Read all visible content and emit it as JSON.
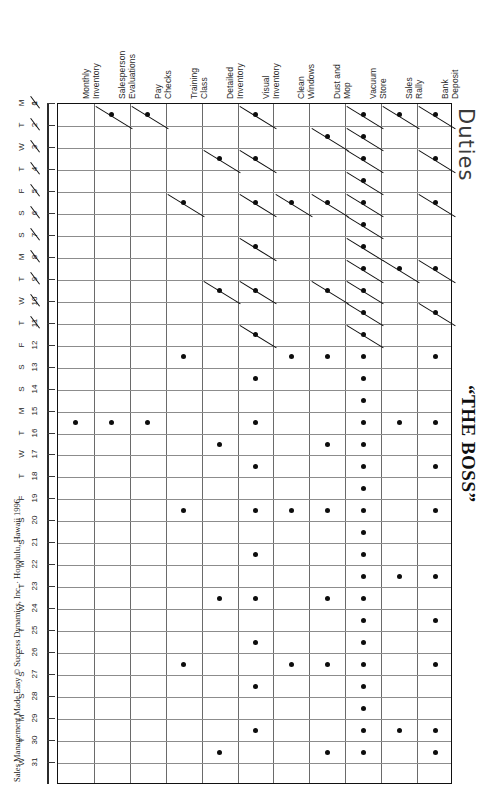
{
  "page": {
    "duties_title": "Duties",
    "boss_title": "“THE BOSS”",
    "credit": "Sales Management Made Easy © Success Dynamics, Inc. · Honolulu, Hawaii 1996",
    "origin_label": "0"
  },
  "columns": [
    {
      "id": "monthly-inventory",
      "line1": "Monthly",
      "line2": "Inventory"
    },
    {
      "id": "salesperson-evaluations",
      "line1": "Salesperson",
      "line2": "Evaluations"
    },
    {
      "id": "pay-checks",
      "line1": "Pay",
      "line2": "Checks"
    },
    {
      "id": "training-class",
      "line1": "Training",
      "line2": "Class"
    },
    {
      "id": "detailed-inventory",
      "line1": "Detailed",
      "line2": "Inventory"
    },
    {
      "id": "visual-inventory",
      "line1": "Visual",
      "line2": "Inventory"
    },
    {
      "id": "clean-windows",
      "line1": "Clean",
      "line2": "Windows"
    },
    {
      "id": "dust-and-mop",
      "line1": "Dust and",
      "line2": "Mop"
    },
    {
      "id": "vacuum-store",
      "line1": "Vacuum",
      "line2": "Store"
    },
    {
      "id": "sales-rally",
      "line1": "Sales",
      "line2": "Rally"
    },
    {
      "id": "bank-deposit",
      "line1": "Bank",
      "line2": "Deposit"
    }
  ],
  "rows": [
    {
      "num": "1",
      "day": "M",
      "struck": true
    },
    {
      "num": "2",
      "day": "T",
      "struck": true
    },
    {
      "num": "3",
      "day": "W",
      "struck": true
    },
    {
      "num": "4",
      "day": "T",
      "struck": true
    },
    {
      "num": "5",
      "day": "F",
      "struck": true
    },
    {
      "num": "6",
      "day": "S",
      "struck": true
    },
    {
      "num": "7",
      "day": "S",
      "struck": true
    },
    {
      "num": "8",
      "day": "M",
      "struck": true
    },
    {
      "num": "9",
      "day": "T",
      "struck": true
    },
    {
      "num": "10",
      "day": "W",
      "struck": true
    },
    {
      "num": "11",
      "day": "T",
      "struck": true
    },
    {
      "num": "12",
      "day": "F",
      "struck": false
    },
    {
      "num": "13",
      "day": "S",
      "struck": false
    },
    {
      "num": "14",
      "day": "S",
      "struck": false
    },
    {
      "num": "15",
      "day": "M",
      "struck": false
    },
    {
      "num": "16",
      "day": "T",
      "struck": false
    },
    {
      "num": "17",
      "day": "W",
      "struck": false
    },
    {
      "num": "18",
      "day": "T",
      "struck": false
    },
    {
      "num": "19",
      "day": "F",
      "struck": false
    },
    {
      "num": "20",
      "day": "S",
      "struck": false
    },
    {
      "num": "21",
      "day": "S",
      "struck": false
    },
    {
      "num": "22",
      "day": "M",
      "struck": false
    },
    {
      "num": "23",
      "day": "T",
      "struck": false
    },
    {
      "num": "24",
      "day": "W",
      "struck": false
    },
    {
      "num": "25",
      "day": "T",
      "struck": false
    },
    {
      "num": "26",
      "day": "F",
      "struck": false
    },
    {
      "num": "27",
      "day": "S",
      "struck": false
    },
    {
      "num": "28",
      "day": "S",
      "struck": false
    },
    {
      "num": "29",
      "day": "M",
      "struck": false
    },
    {
      "num": "30",
      "day": "T",
      "struck": false
    },
    {
      "num": "31",
      "day": "W",
      "struck": false
    }
  ],
  "chart_data": {
    "type": "heatmap",
    "title": "Duties",
    "subtitle": "“THE BOSS”",
    "xlabel": "Duties",
    "ylabel": "Day of Month",
    "grid": true,
    "legend": "none",
    "marker_kinds": {
      "dot": "scheduled duty",
      "slash": "scheduled duty, completed (struck through)"
    },
    "categories": [
      "Monthly Inventory",
      "Salesperson Evaluations",
      "Pay Checks",
      "Training Class",
      "Detailed Inventory",
      "Visual Inventory",
      "Clean Windows",
      "Dust and Mop",
      "Vacuum Store",
      "Sales Rally",
      "Bank Deposit"
    ],
    "x": [
      "1",
      "2",
      "3",
      "4",
      "5",
      "6",
      "7",
      "8",
      "9",
      "10",
      "11",
      "12",
      "13",
      "14",
      "15",
      "16",
      "17",
      "18",
      "19",
      "20",
      "21",
      "22",
      "23",
      "24",
      "25",
      "26",
      "27",
      "28",
      "29",
      "30",
      "31"
    ],
    "cells": [
      {
        "row": 1,
        "cols": [
          2,
          3,
          6,
          9,
          10,
          11
        ],
        "kind": "slash"
      },
      {
        "row": 2,
        "cols": [
          8,
          9
        ],
        "kind": "slash"
      },
      {
        "row": 3,
        "cols": [
          5,
          6,
          9,
          11
        ],
        "kind": "slash"
      },
      {
        "row": 4,
        "cols": [
          9
        ],
        "kind": "slash"
      },
      {
        "row": 5,
        "cols": [
          4,
          6,
          7,
          8,
          9,
          11
        ],
        "kind": "slash"
      },
      {
        "row": 6,
        "cols": [
          9
        ],
        "kind": "slash"
      },
      {
        "row": 7,
        "cols": [
          6,
          9
        ],
        "kind": "slash"
      },
      {
        "row": 8,
        "cols": [
          9,
          10,
          11
        ],
        "kind": "slash"
      },
      {
        "row": 9,
        "cols": [
          5,
          6,
          8,
          9
        ],
        "kind": "slash"
      },
      {
        "row": 10,
        "cols": [
          9,
          11
        ],
        "kind": "slash"
      },
      {
        "row": 11,
        "cols": [
          6,
          9
        ],
        "kind": "slash"
      },
      {
        "row": 12,
        "cols": [
          4,
          7,
          8,
          9,
          11
        ],
        "kind": "dot"
      },
      {
        "row": 13,
        "cols": [
          6,
          9
        ],
        "kind": "dot"
      },
      {
        "row": 14,
        "cols": [
          9
        ],
        "kind": "dot"
      },
      {
        "row": 15,
        "cols": [
          1,
          2,
          3,
          6,
          9,
          10,
          11
        ],
        "kind": "dot"
      },
      {
        "row": 16,
        "cols": [
          5,
          8,
          9
        ],
        "kind": "dot"
      },
      {
        "row": 17,
        "cols": [
          6,
          9,
          11
        ],
        "kind": "dot"
      },
      {
        "row": 18,
        "cols": [
          9
        ],
        "kind": "dot"
      },
      {
        "row": 19,
        "cols": [
          4,
          6,
          7,
          8,
          9,
          11
        ],
        "kind": "dot"
      },
      {
        "row": 20,
        "cols": [
          9
        ],
        "kind": "dot"
      },
      {
        "row": 21,
        "cols": [
          6,
          9
        ],
        "kind": "dot"
      },
      {
        "row": 22,
        "cols": [
          9,
          10,
          11
        ],
        "kind": "dot"
      },
      {
        "row": 23,
        "cols": [
          5,
          6,
          8,
          9
        ],
        "kind": "dot"
      },
      {
        "row": 24,
        "cols": [
          9,
          11
        ],
        "kind": "dot"
      },
      {
        "row": 25,
        "cols": [
          6,
          9
        ],
        "kind": "dot"
      },
      {
        "row": 26,
        "cols": [
          4,
          7,
          8,
          9,
          11
        ],
        "kind": "dot"
      },
      {
        "row": 27,
        "cols": [
          6,
          9
        ],
        "kind": "dot"
      },
      {
        "row": 28,
        "cols": [
          9
        ],
        "kind": "dot"
      },
      {
        "row": 29,
        "cols": [
          6,
          9,
          10,
          11
        ],
        "kind": "dot"
      },
      {
        "row": 30,
        "cols": [
          5,
          8,
          9,
          11
        ],
        "kind": "dot"
      }
    ]
  },
  "geometry": {
    "grid_left": 57,
    "grid_top": 103,
    "grid_right": 452,
    "grid_bottom": 784,
    "cols": 11,
    "rows": 31
  }
}
